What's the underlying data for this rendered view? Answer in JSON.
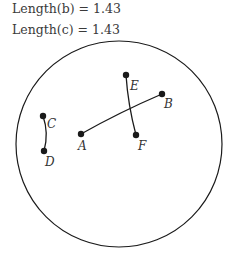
{
  "stats": [
    {
      "label": "Length(b) = 1.43"
    },
    {
      "label": "Length(c) = 1.43"
    }
  ],
  "circle": {
    "cx": 119,
    "cy": 144,
    "r": 103
  },
  "points": [
    {
      "name": "A",
      "x": 81,
      "y": 134,
      "lx": 78,
      "ly": 150
    },
    {
      "name": "B",
      "x": 162,
      "y": 94,
      "lx": 164,
      "ly": 108
    },
    {
      "name": "C",
      "x": 43,
      "y": 116,
      "lx": 47,
      "ly": 128
    },
    {
      "name": "D",
      "x": 44,
      "y": 151,
      "lx": 45,
      "ly": 166
    },
    {
      "name": "E",
      "x": 126,
      "y": 75,
      "lx": 130,
      "ly": 90
    },
    {
      "name": "F",
      "x": 136,
      "y": 135,
      "lx": 138,
      "ly": 150
    }
  ],
  "segments": [
    {
      "name": "AB",
      "path": "M81,134 Q120,112 162,94"
    },
    {
      "name": "CD",
      "path": "M43,116 Q49,133 44,151"
    },
    {
      "name": "EF",
      "path": "M126,75 Q128,105 136,135"
    }
  ],
  "colors": {
    "stroke": "#1a1a1a",
    "text": "#333333"
  }
}
